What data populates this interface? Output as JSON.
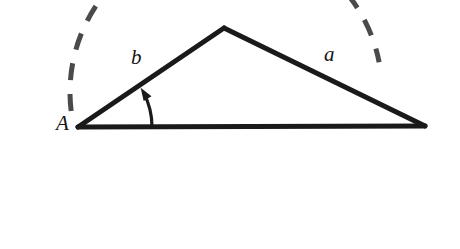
{
  "figure": {
    "kind": "geometry-diagram",
    "background_color": "#ffffff",
    "stroke_color": "#1a1a1a",
    "dashed_arc_color": "#4a4a4a",
    "width": 460,
    "height": 249
  },
  "labels": {
    "vertex_a": "A",
    "side_b": "b",
    "side_a": "a"
  },
  "geometry": {
    "vertex_a": {
      "x": 78,
      "y": 127
    },
    "vertex_apex": {
      "x": 224,
      "y": 28
    },
    "vertex_right": {
      "x": 425,
      "y": 126
    },
    "angle_arc": {
      "start": {
        "x": 151,
        "y": 126
      },
      "end": {
        "x": 139,
        "y": 96
      },
      "radius": 74
    },
    "dashed_arc": {
      "center": {
        "x": 226,
        "y": 92
      },
      "radius": 156,
      "start_angle_deg": 173,
      "end_angle_deg": 349
    }
  }
}
